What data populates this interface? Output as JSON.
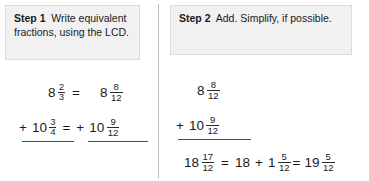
{
  "steps": {
    "step1": {
      "label": "Step 1",
      "text": "Write equivalent fractions, using the LCD."
    },
    "step2": {
      "label": "Step 2",
      "text": "Add. Simplify, if possible."
    }
  },
  "left_column": {
    "row1": {
      "left_whole": "8",
      "left_num": "2",
      "left_den": "3",
      "equals": "=",
      "right_whole": "8",
      "right_num": "8",
      "right_den": "12"
    },
    "row2": {
      "plus": "+",
      "left_whole": "10",
      "left_num": "3",
      "left_den": "4",
      "equals": "=",
      "right_plus": "+",
      "right_whole": "10",
      "right_num": "9",
      "right_den": "12"
    }
  },
  "right_column": {
    "row1": {
      "whole": "8",
      "num": "8",
      "den": "12"
    },
    "row2": {
      "plus": "+",
      "whole": "10",
      "num": "9",
      "den": "12"
    },
    "result": {
      "sum_whole": "18",
      "sum_num": "17",
      "sum_den": "12",
      "equals1": "=",
      "part_whole": "18",
      "plus": "+",
      "mixed_whole": "1",
      "mixed_num": "5",
      "mixed_den": "12",
      "equals2": "=",
      "final_whole": "19",
      "final_num": "5",
      "final_den": "12"
    }
  },
  "colors": {
    "box_background": "#f1f1f1",
    "box_border": "#dcdcdc",
    "divider": "#b9b9b9",
    "text": "#1a1a1a",
    "rule": "#4a4a4a"
  }
}
